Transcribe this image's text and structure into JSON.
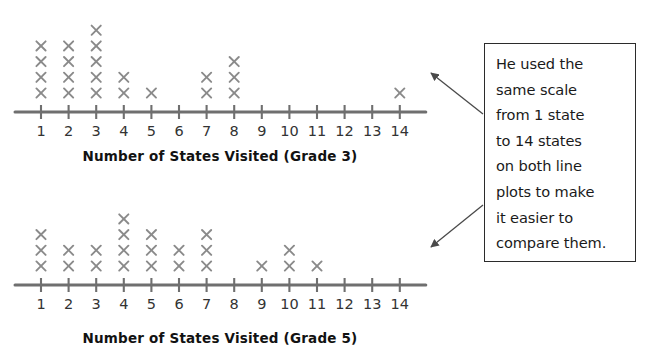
{
  "chart_data": [
    {
      "type": "line_plot",
      "title": "Number of States Visited (Grade 3)",
      "xlabel": "Number of States Visited (Grade 3)",
      "ylabel": "",
      "mark": "x",
      "grid": false,
      "xlim": [
        1,
        14
      ],
      "categories": [
        1,
        2,
        3,
        4,
        5,
        6,
        7,
        8,
        9,
        10,
        11,
        12,
        13,
        14
      ],
      "tick_labels": [
        "1",
        "2",
        "3",
        "4",
        "5",
        "6",
        "7",
        "8",
        "9",
        "10",
        "11",
        "12",
        "13",
        "14"
      ],
      "values": [
        4,
        4,
        5,
        2,
        1,
        0,
        2,
        3,
        0,
        0,
        0,
        0,
        0,
        1
      ],
      "total_marks": 22
    },
    {
      "type": "line_plot",
      "title": "Number of States Visited (Grade 5)",
      "xlabel": "Number of States Visited (Grade 5)",
      "ylabel": "",
      "mark": "x",
      "grid": false,
      "xlim": [
        1,
        14
      ],
      "categories": [
        1,
        2,
        3,
        4,
        5,
        6,
        7,
        8,
        9,
        10,
        11,
        12,
        13,
        14
      ],
      "tick_labels": [
        "1",
        "2",
        "3",
        "4",
        "5",
        "6",
        "7",
        "8",
        "9",
        "10",
        "11",
        "12",
        "13",
        "14"
      ],
      "values": [
        3,
        2,
        2,
        4,
        3,
        2,
        3,
        0,
        1,
        2,
        1,
        0,
        0,
        0
      ],
      "total_marks": 23
    }
  ],
  "plots": [
    {
      "title": "Number of States Visited (Grade 3)"
    },
    {
      "title": "Number of States Visited (Grade 5)"
    }
  ],
  "callout": {
    "text": "He used the\nsame scale\nfrom 1 state\nto 14 states\non both line\nplots to make\nit easier to\ncompare them."
  },
  "colors": {
    "mark": "#8a8a8a",
    "axis": "#6f6f6f",
    "tick_label": "#333333",
    "title": "#121212",
    "callout_border": "#2b2b2b",
    "arrow": "#4a4a4a",
    "background": "#ffffff"
  }
}
